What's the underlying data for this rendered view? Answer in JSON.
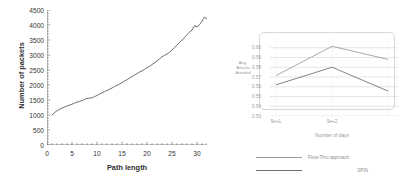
{
  "figure": {
    "panels": [
      "packets-vs-path-length",
      "attacks-avoided-vs-days"
    ]
  },
  "chart_data": [
    {
      "type": "line",
      "id": "left",
      "title": "",
      "xlabel": "Path length",
      "ylabel": "Number of packets",
      "xlim": [
        0,
        32
      ],
      "ylim": [
        0,
        4500
      ],
      "xticks": [
        "0",
        "5",
        "10",
        "15",
        "20",
        "25",
        "30"
      ],
      "yticks": [
        "0",
        "500",
        "1000",
        "1500",
        "2000",
        "2500",
        "3000",
        "3500",
        "4000",
        "4500"
      ],
      "grid": false,
      "legend": "none",
      "line_color": "#555555",
      "x": [
        1,
        1.5,
        2,
        2.5,
        3,
        3.5,
        4,
        4.5,
        5,
        5.5,
        6,
        6.5,
        7,
        7.5,
        8,
        8.5,
        9,
        9.5,
        10,
        10.5,
        11,
        11.5,
        12,
        12.5,
        13,
        13.5,
        14,
        14.5,
        15,
        15.5,
        16,
        16.5,
        17,
        17.5,
        18,
        18.5,
        19,
        19.5,
        20,
        20.5,
        21,
        21.5,
        22,
        22.5,
        23,
        23.5,
        24,
        24.5,
        25,
        25.5,
        26,
        26.5,
        27,
        27.5,
        28,
        28.5,
        29,
        29.5,
        30,
        30.5,
        31,
        31.5,
        32
      ],
      "values": [
        1000,
        1080,
        1140,
        1190,
        1230,
        1265,
        1300,
        1330,
        1360,
        1395,
        1430,
        1455,
        1480,
        1520,
        1555,
        1560,
        1570,
        1610,
        1650,
        1700,
        1740,
        1780,
        1820,
        1860,
        1900,
        1950,
        1990,
        2030,
        2080,
        2130,
        2180,
        2230,
        2280,
        2330,
        2380,
        2430,
        2470,
        2520,
        2580,
        2620,
        2680,
        2740,
        2800,
        2870,
        2940,
        2990,
        3030,
        3090,
        3170,
        3250,
        3330,
        3410,
        3500,
        3580,
        3680,
        3760,
        3830,
        3980,
        3940,
        4010,
        4130,
        4260,
        4200,
        4300,
        4500
      ]
    },
    {
      "type": "line",
      "id": "right",
      "title": "",
      "xlabel": "Number of days",
      "ylabel": "Avg.\nAttacks\nAvoided",
      "ylabel_lines": [
        "Avg.",
        "Attacks",
        "Avoided"
      ],
      "xlim": [
        0,
        3
      ],
      "ylim": [
        0.53,
        0.61
      ],
      "xticks": [
        "5e+1",
        "5e+2"
      ],
      "yticks": [
        "0.60",
        "0.59",
        "0.58",
        "0.57",
        "0.56",
        "0.55",
        "0.54",
        "0.53"
      ],
      "grid": true,
      "grid_color": "#cccccc",
      "legend_position": "bottom",
      "categories": [
        "5e+1",
        "5e+2",
        "5e+3"
      ],
      "series": [
        {
          "name": "Flow-Thru approach",
          "color": "#9a9a9a",
          "values": [
            0.5715,
            0.6015,
            0.588
          ]
        },
        {
          "name": "SPIN",
          "color": "#6e6e6e",
          "values": [
            0.562,
            0.58,
            0.5555
          ]
        }
      ]
    }
  ]
}
